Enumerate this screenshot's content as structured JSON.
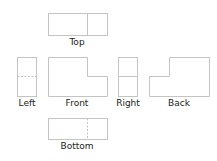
{
  "diagram": {
    "line_color": "#c4c4c4",
    "views": [
      {
        "id": "top",
        "label": "Top"
      },
      {
        "id": "left",
        "label": "Left"
      },
      {
        "id": "front",
        "label": "Front"
      },
      {
        "id": "right",
        "label": "Right"
      },
      {
        "id": "back",
        "label": "Back"
      },
      {
        "id": "bottom",
        "label": "Bottom"
      }
    ]
  }
}
